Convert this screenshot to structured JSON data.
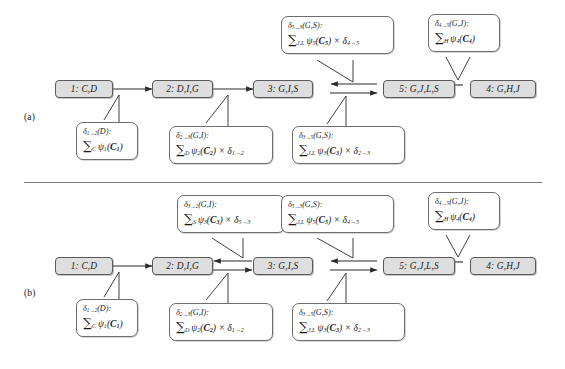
{
  "figure": {
    "type": "diagram",
    "divider": true
  },
  "panels": [
    {
      "id": "a",
      "label": "(a)",
      "nodes": [
        {
          "id": "n1",
          "text": "1: C,D"
        },
        {
          "id": "n2",
          "text": "2: D,I,G"
        },
        {
          "id": "n3",
          "text": "3: G,I,S"
        },
        {
          "id": "n5",
          "text": "5: G,J,L,S"
        },
        {
          "id": "n4",
          "text": "4: G,H,J"
        }
      ],
      "messages": [
        {
          "id": "m_1_2",
          "line1_delta": "δ",
          "line1_sub": "1→2",
          "line1_args": "(D):",
          "line2_sum": "∑",
          "line2_sumsub": "C",
          "line2_body": "ψ",
          "line2_bodysub": "1",
          "line2_tail": "(C",
          "line2_tailsub": "1",
          "line2_end": ")",
          "text": "δ₁→₂(D): ∑_C ψ₁(C₁)"
        },
        {
          "id": "m_2_3",
          "text": "δ₂→₃(G,I): ∑_D ψ₂(C₂) × δ₁→₂"
        },
        {
          "id": "m_3_5",
          "text": "δ₃→₅(G,S): ∑_{J,L} ψ₃(C₃) × δ₂→₃"
        },
        {
          "id": "m_5_3",
          "text": "δ₅→₃(G,S): ∑_{J,L} ψ₅(C₅) × δ₄→₅"
        },
        {
          "id": "m_4_5",
          "text": "δ₄→₅(G,J): ∑_H ψ₄(C₄)"
        }
      ],
      "edges": [
        {
          "from": "n1",
          "to": "n2",
          "direction": "right"
        },
        {
          "from": "n2",
          "to": "n3",
          "direction": "right"
        },
        {
          "from": "n3",
          "to": "n5",
          "direction": "right"
        },
        {
          "from": "n5",
          "to": "n3",
          "direction": "left"
        },
        {
          "from": "n4",
          "to": "n5",
          "direction": "left"
        }
      ]
    },
    {
      "id": "b",
      "label": "(b)",
      "nodes": [
        {
          "id": "n1",
          "text": "1: C,D"
        },
        {
          "id": "n2",
          "text": "2: D,I,G"
        },
        {
          "id": "n3",
          "text": "3: G,I,S"
        },
        {
          "id": "n5",
          "text": "5: G,J,L,S"
        },
        {
          "id": "n4",
          "text": "4: G,H,J"
        }
      ],
      "messages": [
        {
          "id": "m_1_2",
          "text": "δ₁→₂(D): ∑_C ψ₁(C₁)"
        },
        {
          "id": "m_2_3",
          "text": "δ₂→₃(G,I): ∑_D ψ₂(C₂) × δ₁→₂"
        },
        {
          "id": "m_3_5",
          "text": "δ₃→₅(G,S): ∑_{J,L} ψ₃(C₃) × δ₂→₃"
        },
        {
          "id": "m_3_2",
          "text": "δ₃→₂(G,I): ∑_S ψ₃(C₃) × δ₅→₃"
        },
        {
          "id": "m_5_3",
          "text": "δ₅→₃(G,S): ∑_{J,L} ψ₅(C₅) × δ₄→₅"
        },
        {
          "id": "m_4_5",
          "text": "δ₄→₅(G,J): ∑_H ψ₄(C₄)"
        }
      ],
      "edges": [
        {
          "from": "n1",
          "to": "n2",
          "direction": "right"
        },
        {
          "from": "n2",
          "to": "n3",
          "direction": "right"
        },
        {
          "from": "n3",
          "to": "n2",
          "direction": "left"
        },
        {
          "from": "n3",
          "to": "n5",
          "direction": "right"
        },
        {
          "from": "n5",
          "to": "n3",
          "direction": "left"
        },
        {
          "from": "n4",
          "to": "n5",
          "direction": "left"
        }
      ]
    }
  ],
  "colors": {
    "node_fill": "#dedede",
    "node_border": "#5a5a5a",
    "msg_border": "#6e6e6e",
    "line": "#2a2a2a",
    "background": "#ffffff"
  }
}
